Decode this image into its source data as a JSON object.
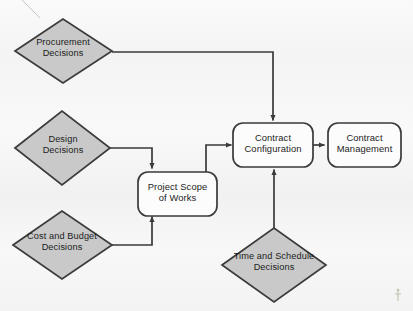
{
  "diagram": {
    "type": "flowchart",
    "background_color": "#f7f7f7",
    "shape_fill_diamond": "#c9c9c9",
    "shape_fill_box": "#fcfcfc",
    "stroke_color": "#3a3a3a",
    "text_color": "#1c1c1c"
  },
  "nodes": {
    "procurement": {
      "shape": "diamond",
      "line1": "Procurement",
      "line2": "Decisions"
    },
    "design": {
      "shape": "diamond",
      "line1": "Design",
      "line2": "Decisions"
    },
    "cost_budget": {
      "shape": "diamond",
      "line1": "Cost and Budget",
      "line2": "Decisions"
    },
    "time_schedule": {
      "shape": "diamond",
      "line1": "Time and Schedule",
      "line2": "Decisions"
    },
    "project_scope": {
      "shape": "rounded-rect",
      "line1": "Project Scope",
      "line2": "of Works"
    },
    "contract_configuration": {
      "shape": "rounded-rect",
      "line1": "Contract",
      "line2": "Configuration"
    },
    "contract_management": {
      "shape": "rounded-rect",
      "line1": "Contract",
      "line2": "Management"
    }
  },
  "edges": [
    {
      "name": "procurement-to-contract-configuration",
      "from": "procurement",
      "to": "contract_configuration",
      "arrowhead": true
    },
    {
      "name": "design-to-project-scope",
      "from": "design",
      "to": "project_scope",
      "arrowhead": true
    },
    {
      "name": "cost-budget-to-project-scope",
      "from": "cost_budget",
      "to": "project_scope",
      "arrowhead": true
    },
    {
      "name": "project-scope-to-contract-configuration",
      "from": "project_scope",
      "to": "contract_configuration",
      "arrowhead": true
    },
    {
      "name": "time-schedule-to-contract-configuration",
      "from": "time_schedule",
      "to": "contract_configuration",
      "arrowhead": true
    },
    {
      "name": "contract-configuration-to-contract-management",
      "from": "contract_configuration",
      "to": "contract_management",
      "arrowhead": true
    }
  ]
}
